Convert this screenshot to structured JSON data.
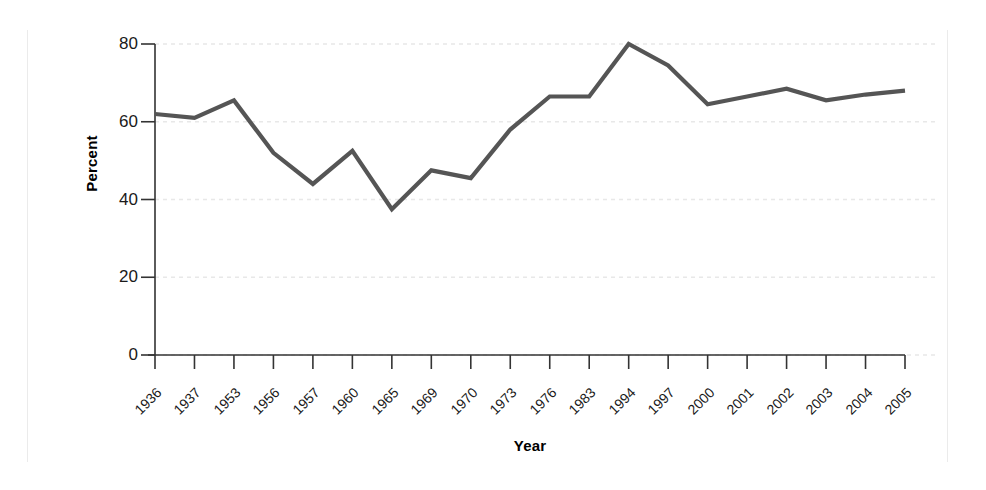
{
  "chart_data": {
    "type": "line",
    "title": "",
    "xlabel": "Year",
    "ylabel": "Percent",
    "categories": [
      "1936",
      "1937",
      "1953",
      "1956",
      "1957",
      "1960",
      "1965",
      "1969",
      "1970",
      "1973",
      "1976",
      "1983",
      "1994",
      "1997",
      "2000",
      "2001",
      "2002",
      "2003",
      "2004",
      "2005"
    ],
    "values": [
      62.0,
      61.0,
      65.5,
      52.0,
      44.0,
      52.5,
      37.5,
      47.5,
      45.5,
      58.0,
      66.5,
      66.5,
      80.0,
      74.5,
      64.5,
      66.5,
      68.5,
      65.5,
      67.0,
      68.0
    ],
    "ylim": [
      0,
      80
    ],
    "yticks": [
      0,
      20,
      40,
      60,
      80
    ],
    "ytick_labels": [
      "0",
      "20",
      "40",
      "60",
      "80"
    ],
    "grid": "horizontal-dashed",
    "legend": "none",
    "series": [
      {
        "name": "Percent",
        "color": "#555555",
        "values": [
          62.0,
          61.0,
          65.5,
          52.0,
          44.0,
          52.5,
          37.5,
          47.5,
          45.5,
          58.0,
          66.5,
          66.5,
          80.0,
          74.5,
          64.5,
          66.5,
          68.5,
          65.5,
          67.0,
          68.0
        ]
      }
    ]
  },
  "axis": {
    "y_title": "Percent",
    "x_title": "Year"
  },
  "colors": {
    "line": "#555555",
    "axis": "#333333",
    "grid": "#e8e8e8",
    "edge_rule": "#ebebeb",
    "text": "#1a1a1a",
    "background": "#ffffff"
  }
}
